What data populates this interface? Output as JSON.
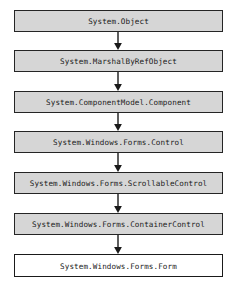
{
  "diagram": {
    "type": "inheritance-hierarchy",
    "orientation": "vertical-top-down",
    "background_color": "#ffffff",
    "node_fill_color": "#d6d6d6",
    "leaf_fill_color": "#ffffff",
    "border_color": "#252525",
    "arrow_color": "#1a1a1a",
    "nodes": [
      {
        "label": "System.Object",
        "level": 0,
        "style": "filled",
        "top": 10
      },
      {
        "label": "System.MarshalByRefObject",
        "level": 1,
        "style": "filled",
        "top": 50
      },
      {
        "label": "System.ComponentModel.Component",
        "level": 2,
        "style": "filled",
        "top": 91
      },
      {
        "label": "System.Windows.Forms.Control",
        "level": 3,
        "style": "filled",
        "top": 131
      },
      {
        "label": "System.Windows.Forms.ScrollableControl",
        "level": 4,
        "style": "filled",
        "top": 172
      },
      {
        "label": "System.Windows.Forms.ContainerControl",
        "level": 5,
        "style": "filled",
        "top": 213
      },
      {
        "label": "System.Windows.Forms.Form",
        "level": 6,
        "style": "outlined",
        "top": 254
      }
    ],
    "connectors": [
      {
        "from": "System.Object",
        "to": "System.MarshalByRefObject",
        "kind": "arrow-down",
        "top": 32,
        "height": 18
      },
      {
        "from": "System.MarshalByRefObject",
        "to": "System.ComponentModel.Component",
        "kind": "arrow-down",
        "top": 72,
        "height": 19
      },
      {
        "from": "System.ComponentModel.Component",
        "to": "System.Windows.Forms.Control",
        "kind": "arrow-down",
        "top": 113,
        "height": 18
      },
      {
        "from": "System.Windows.Forms.Control",
        "to": "System.Windows.Forms.ScrollableControl",
        "kind": "arrow-down",
        "top": 153,
        "height": 19
      },
      {
        "from": "System.Windows.Forms.ScrollableControl",
        "to": "System.Windows.Forms.ContainerControl",
        "kind": "arrow-down",
        "top": 194,
        "height": 19
      },
      {
        "from": "System.Windows.Forms.ContainerControl",
        "to": "System.Windows.Forms.Form",
        "kind": "arrow-down",
        "top": 235,
        "height": 19
      }
    ]
  }
}
